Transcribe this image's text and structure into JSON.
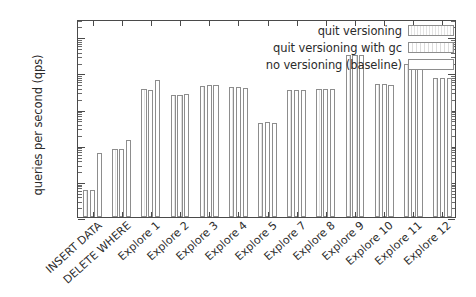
{
  "chart_data": {
    "type": "bar",
    "title": "",
    "xlabel": "",
    "ylabel": "queries per second (qps)",
    "yscale": "log",
    "ylim": [
      0.01,
      3000
    ],
    "ytick_labels": [
      "0.01",
      "0.1",
      "1",
      "10",
      "100",
      "1000"
    ],
    "ytick_values": [
      0.01,
      0.1,
      1,
      10,
      100,
      1000
    ],
    "grid": false,
    "legend_position": "top-right",
    "categories": [
      "INSERT DATA",
      "DELETE WHERE",
      "Explore 1",
      "Explore 2",
      "Explore 3",
      "Explore 4",
      "Explore 5",
      "Explore 7",
      "Explore 8",
      "Explore 9",
      "Explore 10",
      "Explore 11",
      "Explore 12"
    ],
    "series": [
      {
        "name": "quit versioning",
        "values": [
          0.055,
          0.78,
          34,
          23,
          42,
          39,
          4.1,
          33,
          34,
          300,
          48,
          170,
          70
        ]
      },
      {
        "name": "quit versioning with gc",
        "values": [
          0.055,
          0.78,
          33,
          24,
          44,
          39,
          4.2,
          33,
          34,
          300,
          47,
          175,
          70
        ]
      },
      {
        "name": "no versioning (baseline)",
        "values": [
          0.6,
          1.35,
          62,
          25,
          44,
          38,
          4.1,
          33,
          35,
          310,
          46,
          180,
          70
        ]
      }
    ],
    "series_colors": [
      "#e3e3e3",
      "#dcdcdc",
      "#ffffff"
    ],
    "series_outline": "#8d8d8d",
    "axis_color": "#4a4a4a",
    "background": "#ffffff"
  }
}
